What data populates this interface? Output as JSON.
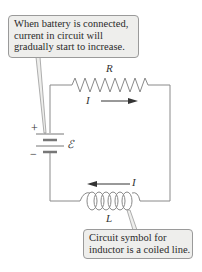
{
  "diagram": {
    "callouts": {
      "top": {
        "lines": [
          "When battery is connected,",
          "current in circuit will",
          "gradually start to increase."
        ]
      },
      "bottom": {
        "lines": [
          "Circuit symbol for",
          "inductor is a coiled line."
        ]
      }
    },
    "labels": {
      "resistor": "R",
      "current_top": "I",
      "current_bottom": "I",
      "inductor": "L",
      "emf": "ℰ",
      "plus": "+",
      "minus": "−"
    },
    "components": [
      {
        "type": "battery",
        "label": "ℰ"
      },
      {
        "type": "resistor",
        "label": "R"
      },
      {
        "type": "inductor",
        "label": "L"
      }
    ],
    "colors": {
      "wire": "#8a8a8a",
      "callout_bg": "#eeeeec",
      "callout_border": "#9a9a9a",
      "text": "#2a2a2a"
    }
  }
}
